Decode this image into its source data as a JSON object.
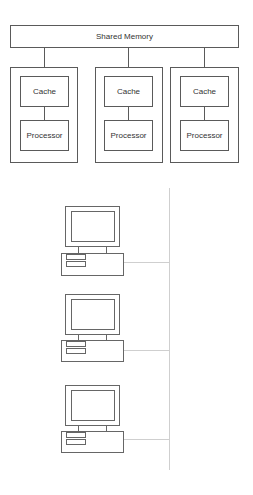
{
  "shared_memory": {
    "label": "Shared Memory"
  },
  "processor_nodes": [
    {
      "cache_label": "Cache",
      "processor_label": "Processor"
    },
    {
      "cache_label": "Cache",
      "processor_label": "Processor"
    },
    {
      "cache_label": "Cache",
      "processor_label": "Processor"
    }
  ],
  "network": {
    "computers": [
      {
        "icon": "desktop-computer-icon"
      },
      {
        "icon": "desktop-computer-icon"
      },
      {
        "icon": "desktop-computer-icon"
      }
    ]
  },
  "colors": {
    "line": "#5a5a5a",
    "network_line": "#cfcfcf",
    "background": "#ffffff"
  }
}
